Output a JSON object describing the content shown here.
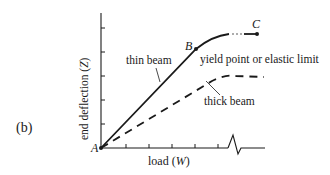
{
  "panel_label": "(b)",
  "axes": {
    "y_label": "end deflection (Z)",
    "y_label_text": "end deflection (",
    "y_label_var": "Z",
    "y_label_close": ")",
    "x_label_text": "load (",
    "x_label_var": "W",
    "x_label_close": ")"
  },
  "points": {
    "origin": "A",
    "yield": "B",
    "end": "C"
  },
  "annotations": {
    "thin_beam": "thin beam",
    "thick_beam": "thick beam",
    "yield_point": "yield point or elastic limit"
  },
  "colors": {
    "ink": "#1a1a1a",
    "background": "#ffffff"
  }
}
